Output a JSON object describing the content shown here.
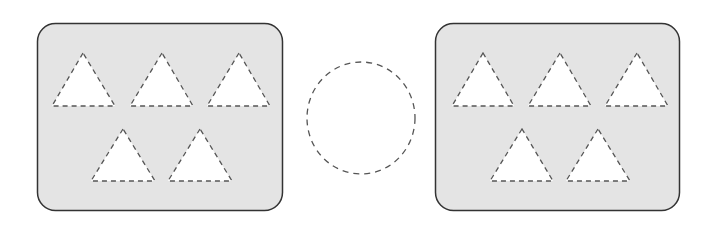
{
  "diagram": {
    "colors": {
      "panel_fill": "#e4e4e4",
      "panel_stroke": "#333333",
      "shape_fill": "#ffffff",
      "dash_stroke": "#555555"
    },
    "panels": [
      {
        "name": "left-panel",
        "triangle_count": 5
      },
      {
        "name": "right-panel",
        "triangle_count": 5
      }
    ],
    "middle_shape": "ellipse"
  }
}
